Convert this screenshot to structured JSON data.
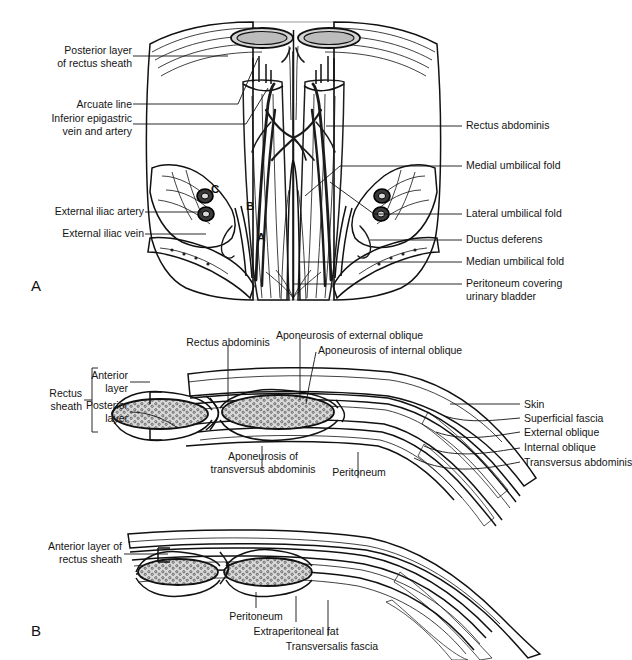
{
  "figure": {
    "background_color": "#ffffff",
    "ink_color": "#141414",
    "panels": [
      {
        "letter": "A",
        "caption": "Posterior (internal) view of the lower anterior abdominal wall"
      },
      {
        "letter": "B",
        "caption": "Cross-sections of the rectus sheath above and below the arcuate line"
      }
    ]
  },
  "panel_a": {
    "letter": "A",
    "labels_left": [
      {
        "id": "posterior-layer-of-rectus-sheath",
        "line1": "Posterior layer",
        "line2": "of rectus sheath"
      },
      {
        "id": "arcuate-line",
        "line1": "Arcuate line",
        "line2": ""
      },
      {
        "id": "inferior-epigastric-vein-and-artery",
        "line1": "Inferior epigastric",
        "line2": "vein and artery"
      },
      {
        "id": "external-iliac-artery",
        "line1": "External iliac artery",
        "line2": ""
      },
      {
        "id": "external-iliac-vein",
        "line1": "External iliac vein",
        "line2": ""
      }
    ],
    "labels_right": [
      {
        "id": "rectus-abdominis",
        "line1": "Rectus abdominis",
        "line2": ""
      },
      {
        "id": "medial-umbilical-fold",
        "line1": "Medial umbilical fold",
        "line2": ""
      },
      {
        "id": "lateral-umbilical-fold",
        "line1": "Lateral umbilical fold",
        "line2": ""
      },
      {
        "id": "ductus-deferens",
        "line1": "Ductus deferens",
        "line2": ""
      },
      {
        "id": "median-umbilical-fold",
        "line1": "Median umbilical fold",
        "line2": ""
      },
      {
        "id": "peritoneum-covering-urinary-bladder",
        "line1": "Peritoneum covering",
        "line2": "urinary bladder"
      }
    ],
    "fossa_markers": [
      {
        "id": "supravesical-fossa",
        "text": "A"
      },
      {
        "id": "medial-inguinal-fossa",
        "text": "B"
      },
      {
        "id": "lateral-inguinal-fossa",
        "text": "C"
      }
    ]
  },
  "panel_b_upper": {
    "labels_top": [
      {
        "id": "rectus-abdominis",
        "line1": "Rectus abdominis",
        "line2": ""
      },
      {
        "id": "aponeurosis-of-external-oblique",
        "line1": "Aponeurosis of external oblique",
        "line2": ""
      },
      {
        "id": "aponeurosis-of-internal-oblique",
        "line1": "Aponeurosis of internal oblique",
        "line2": ""
      }
    ],
    "bracket": {
      "id": "rectus-sheath",
      "line1": "Rectus",
      "line2": "sheath",
      "items": [
        {
          "id": "anterior-layer",
          "line1": "Anterior",
          "line2": "layer"
        },
        {
          "id": "posterior-layer",
          "line1": "Posterior",
          "line2": "layer"
        }
      ]
    },
    "labels_right": [
      {
        "id": "skin",
        "text": "Skin"
      },
      {
        "id": "superficial-fascia",
        "text": "Superficial fascia"
      },
      {
        "id": "external-oblique",
        "text": "External oblique"
      },
      {
        "id": "internal-oblique",
        "text": "Internal oblique"
      },
      {
        "id": "transversus-abdominis",
        "text": "Transversus abdominis"
      }
    ],
    "labels_bottom": [
      {
        "id": "aponeurosis-of-transversus-abdominis",
        "line1": "Aponeurosis of",
        "line2": "transversus abdominis"
      },
      {
        "id": "peritoneum",
        "line1": "Peritoneum",
        "line2": ""
      }
    ]
  },
  "panel_b_lower": {
    "letter": "B",
    "labels_left": [
      {
        "id": "anterior-layer-of-rectus-sheath",
        "line1": "Anterior layer of",
        "line2": "rectus sheath"
      }
    ],
    "labels_bottom": [
      {
        "id": "peritoneum",
        "text": "Peritoneum"
      },
      {
        "id": "extraperitoneal-fat",
        "text": "Extraperitoneal fat"
      },
      {
        "id": "transversalis-fascia",
        "text": "Transversalis fascia"
      }
    ]
  }
}
